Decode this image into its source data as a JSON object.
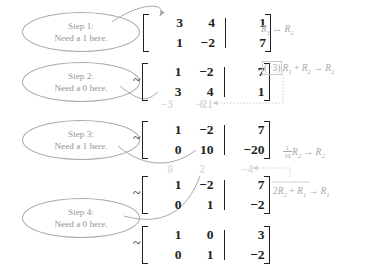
{
  "figure": {
    "colors": {
      "ink": "#231f20",
      "annotation_gray": "#a7a9ac",
      "ghost_gray": "#dcdddf"
    }
  },
  "callouts": [
    {
      "id": "step1",
      "line1": "Step 1:",
      "line2": "Need a 1 here."
    },
    {
      "id": "step2",
      "line1": "Step 2:",
      "line2": "Need a 0 here."
    },
    {
      "id": "step3",
      "line1": "Step 3:",
      "line2": "Need a 1 here."
    },
    {
      "id": "step4",
      "line1": "Step 4:",
      "line2": "Need a 0 here."
    }
  ],
  "matrices": [
    {
      "id": "matrix-1",
      "tilde": "",
      "rows": [
        {
          "c1": "3",
          "c2": "4",
          "aug": "1"
        },
        {
          "c1": "1",
          "c2": "−2",
          "aug": "7"
        }
      ]
    },
    {
      "id": "matrix-2",
      "tilde": "~",
      "rows": [
        {
          "c1": "1",
          "c2": "−2",
          "aug": "7"
        },
        {
          "c1": "3",
          "c2": "4",
          "aug": "1"
        }
      ]
    },
    {
      "id": "matrix-3",
      "tilde": "~",
      "rows": [
        {
          "c1": "1",
          "c2": "−2",
          "aug": "7"
        },
        {
          "c1": "0",
          "c2": "10",
          "aug": "−20"
        }
      ]
    },
    {
      "id": "matrix-4",
      "tilde": "~",
      "rows": [
        {
          "c1": "1",
          "c2": "−2",
          "aug": "7"
        },
        {
          "c1": "0",
          "c2": "1",
          "aug": "−2"
        }
      ]
    },
    {
      "id": "matrix-5",
      "tilde": "~",
      "rows": [
        {
          "c1": "1",
          "c2": "0",
          "aug": "3"
        },
        {
          "c1": "0",
          "c2": "1",
          "aug": "−2"
        }
      ]
    }
  ],
  "row_operations": [
    {
      "id": "op-1",
      "text": "R1 ↔ R2",
      "parts": {
        "lead": "",
        "r_a": "R",
        "sub_a": "1",
        "arrow": " ↔ ",
        "r_b": "R",
        "sub_b": "2"
      }
    },
    {
      "id": "op-2",
      "text": "(−3)R1 + R2 → R2",
      "parts": {
        "scalar": "(−3)",
        "r_a": "R",
        "sub_a": "1",
        "plus": " + ",
        "r_b": "R",
        "sub_b": "2",
        "arrow": " → ",
        "r_c": "R",
        "sub_c": "2"
      }
    },
    {
      "id": "op-3",
      "text": "(1/10)R2 → R2",
      "parts": {
        "num": "1",
        "den": "10",
        "r_a": "R",
        "sub_a": "2",
        "arrow": " → ",
        "r_b": "R",
        "sub_b": "2"
      }
    },
    {
      "id": "op-4",
      "text": "2R2 + R1 → R1",
      "parts": {
        "scalar": "2",
        "r_a": "R",
        "sub_a": "2",
        "plus": " + ",
        "r_b": "R",
        "sub_b": "1",
        "arrow": " → ",
        "r_c": "R",
        "sub_c": "1"
      }
    }
  ],
  "ghost_rows": [
    {
      "id": "ghost-1",
      "c1": "−3",
      "c2": "6",
      "aug": "−21"
    },
    {
      "id": "ghost-2",
      "c1": "0",
      "c2": "2",
      "aug": "−4"
    }
  ]
}
